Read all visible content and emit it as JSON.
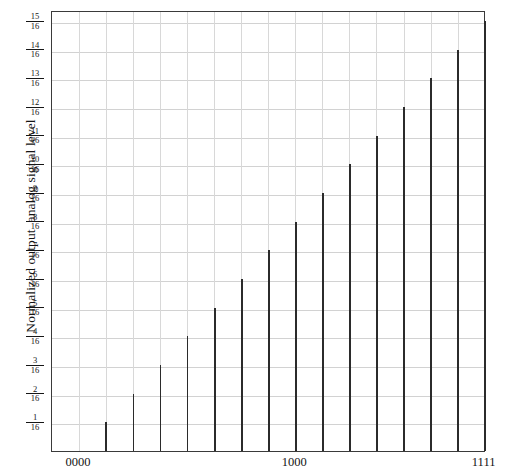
{
  "chart_data": {
    "type": "bar",
    "title": "",
    "subtitle": "",
    "xlabel": "",
    "ylabel": "Normalized output  analog signal level",
    "categories": [
      "0000",
      "0001",
      "0010",
      "0011",
      "0100",
      "0101",
      "0110",
      "0111",
      "1000",
      "1001",
      "1010",
      "1011",
      "1100",
      "1101",
      "1110",
      "1111"
    ],
    "values": [
      0,
      0.0625,
      0.125,
      0.1875,
      0.25,
      0.3125,
      0.375,
      0.4375,
      0.5,
      0.5625,
      0.625,
      0.6875,
      0.75,
      0.8125,
      0.875,
      0.9375
    ],
    "value_fractions": [
      "0/16",
      "1/16",
      "2/16",
      "3/16",
      "4/16",
      "5/16",
      "6/16",
      "7/16",
      "8/16",
      "9/16",
      "10/16",
      "11/16",
      "12/16",
      "13/16",
      "14/16",
      "15/16"
    ],
    "ylim": [
      0,
      0.9375
    ],
    "xlim": [
      0,
      15
    ],
    "grid": true,
    "legend": null,
    "y_tick_labels": [
      {
        "num": "15",
        "den": "16",
        "value": 0.9375
      },
      {
        "num": "14",
        "den": "16",
        "value": 0.875
      },
      {
        "num": "13",
        "den": "16",
        "value": 0.8125
      },
      {
        "num": "12",
        "den": "16",
        "value": 0.75
      },
      {
        "num": "11",
        "den": "16",
        "value": 0.6875
      },
      {
        "num": "10",
        "den": "16",
        "value": 0.625
      },
      {
        "num": "9",
        "den": "16",
        "value": 0.5625
      },
      {
        "num": "8",
        "den": "16",
        "value": 0.5
      },
      {
        "num": "7",
        "den": "16",
        "value": 0.4375
      },
      {
        "num": "6",
        "den": "16",
        "value": 0.375
      },
      {
        "num": "5",
        "den": "16",
        "value": 0.3125
      },
      {
        "num": "4",
        "den": "16",
        "value": 0.25
      },
      {
        "num": "3",
        "den": "16",
        "value": 0.1875
      },
      {
        "num": "2",
        "den": "16",
        "value": 0.125
      },
      {
        "num": "1",
        "den": "16",
        "value": 0.0625
      }
    ],
    "x_tick_labels": [
      {
        "label": "0000",
        "index": 0
      },
      {
        "label": "1000",
        "index": 8
      },
      {
        "label": "1111",
        "index": 15
      }
    ],
    "colors": {
      "bar": "#2b2b2b",
      "grid": "#d2d2d2",
      "frame": "#3a3a3a",
      "text": "#141414",
      "background": "#ffffff"
    }
  }
}
